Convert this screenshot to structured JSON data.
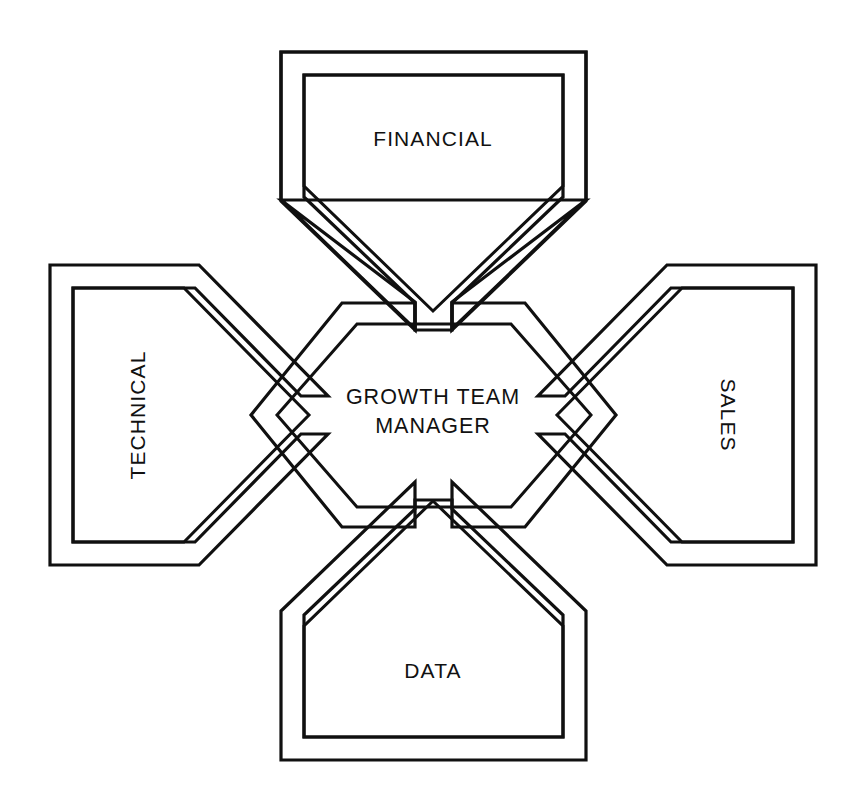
{
  "diagram": {
    "type": "hub-and-spoke",
    "title_text": "GROWTH TEAM MANAGER",
    "background_color": "#ffffff",
    "line_color": "#101010",
    "center": {
      "id": "growth-team-manager",
      "shape": "hexagon",
      "line1": "GROWTH TEAM",
      "line2": "MANAGER",
      "orientation": "horizontal"
    },
    "arms": [
      {
        "id": "financial",
        "label": "FINANCIAL",
        "position": "top",
        "shape": "pentagon",
        "orientation": "horizontal",
        "rotation_deg": 0
      },
      {
        "id": "sales",
        "label": "SALES",
        "position": "right",
        "shape": "pentagon",
        "orientation": "vertical",
        "rotation_deg": 90
      },
      {
        "id": "data",
        "label": "DATA",
        "position": "bottom",
        "shape": "pentagon",
        "orientation": "horizontal",
        "rotation_deg": 0
      },
      {
        "id": "technical",
        "label": "TECHNICAL",
        "position": "left",
        "shape": "pentagon",
        "orientation": "vertical",
        "rotation_deg": -90
      }
    ]
  }
}
